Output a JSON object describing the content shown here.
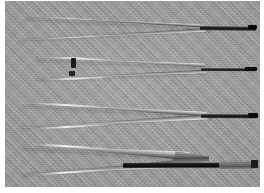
{
  "image": {
    "title": "Four pairs of tweezers on gray woven background",
    "subject": "tweezers",
    "count": 4,
    "color_mode": "grayscale",
    "background_color": "#9c9c9c",
    "border_color": "#ffffff",
    "texture": "diagonal-woven-fabric"
  },
  "canvas": {
    "width": 264,
    "height": 193,
    "photo_left": 5,
    "photo_top": 1,
    "photo_width": 255,
    "photo_height": 186
  },
  "instruments": [
    {
      "name": "tweezer-1",
      "label": "fine-point tweezers, top",
      "tip_style": "fine pointed",
      "tip_color": "#0a0a0a",
      "row_y": 14,
      "marks": []
    },
    {
      "name": "tweezer-2",
      "label": "fine-point tweezers with dark markings",
      "tip_style": "fine pointed",
      "tip_color": "#0a0a0a",
      "row_y": 56,
      "marks": [
        "upper-arm-dark-block",
        "lower-arm-dark-block"
      ]
    },
    {
      "name": "tweezer-3",
      "label": "fine-point tweezers, third",
      "tip_style": "fine pointed",
      "tip_color": "#0a0a0a",
      "row_y": 101,
      "marks": []
    },
    {
      "name": "tweezer-4",
      "label": "broad flat-tip forceps, bottom",
      "tip_style": "broad flat blunt",
      "tip_color": "#555555",
      "row_y": 143,
      "marks": []
    }
  ]
}
